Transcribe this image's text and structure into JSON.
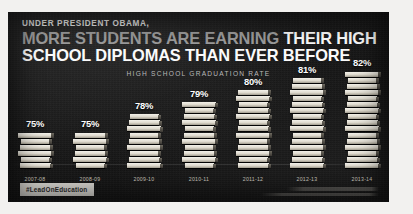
{
  "poster": {
    "kicker": "UNDER PRESIDENT OBAMA,",
    "headline_gray": "MORE STUDENTS ARE EARNING",
    "headline_white_1": "THEIR HIGH",
    "headline_white_2": "SCHOOL DIPLOMAS THAN EVER BEFORE",
    "subtitle": "HIGH SCHOOL GRADUATION RATE",
    "hashtag": "#LeadOnEducation",
    "background_color": "#1b1b1b",
    "accent_gray": "#9a9a9a",
    "accent_white": "#fbfbfb",
    "badge_color": "#d7d5cf"
  },
  "chart_data": {
    "type": "bar",
    "title": "HIGH SCHOOL GRADUATION RATE",
    "xlabel": "",
    "ylabel": "",
    "ylim": [
      0,
      100
    ],
    "grid": false,
    "legend": "none",
    "categories": [
      "2007-08",
      "2008-09",
      "2009-10",
      "2010-11",
      "2011-12",
      "2012-13",
      "2013-14"
    ],
    "values": [
      75,
      75,
      78,
      79,
      80,
      81,
      82
    ],
    "value_labels": [
      "75%",
      "75%",
      "78%",
      "79%",
      "80%",
      "81%",
      "82%"
    ],
    "book_counts": [
      6,
      6,
      9,
      11,
      13,
      15,
      16
    ],
    "marker": "stacked-books"
  }
}
